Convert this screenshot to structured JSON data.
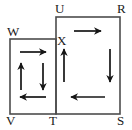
{
  "figure": {
    "type": "geometry-diagram",
    "background_color": "#ffffff",
    "stroke_color": "#4d4d4d",
    "arrow_color": "#161616",
    "label_color": "#1a1a1a",
    "canvas": {
      "width": 132,
      "height": 130
    },
    "labels": {
      "W": "W",
      "U": "U",
      "R": "R",
      "X": "X",
      "V": "V",
      "T": "T",
      "S": "S"
    },
    "label_positions": {
      "W": {
        "x": 7,
        "y": 25
      },
      "U": {
        "x": 55,
        "y": 2
      },
      "R": {
        "x": 117,
        "y": 2
      },
      "X": {
        "x": 57,
        "y": 34
      },
      "V": {
        "x": 6,
        "y": 114
      },
      "T": {
        "x": 49,
        "y": 114
      },
      "S": {
        "x": 117,
        "y": 114
      }
    },
    "rectangles": [
      {
        "name": "left-rectangle-WXTV",
        "vertices": [
          "W",
          "X",
          "T",
          "V"
        ],
        "x": 10,
        "y": 39,
        "width": 46,
        "height": 75
      },
      {
        "name": "right-rectangle-URST",
        "vertices": [
          "U",
          "R",
          "S",
          "T"
        ],
        "x": 56,
        "y": 17,
        "width": 64,
        "height": 97
      }
    ],
    "shared_edge": {
      "name": "edge-XT",
      "from": "X",
      "to": "T"
    },
    "arrows": [
      {
        "name": "left-rect-top-arrow",
        "direction": "right",
        "x1": 20,
        "y1": 52,
        "x2": 46,
        "y2": 52
      },
      {
        "name": "left-rect-inner-up-arrow",
        "direction": "up",
        "x1": 21,
        "y1": 90,
        "x2": 21,
        "y2": 63
      },
      {
        "name": "left-rect-inner-down-arrow",
        "direction": "down",
        "x1": 43,
        "y1": 63,
        "x2": 43,
        "y2": 90
      },
      {
        "name": "left-rect-bottom-arrow",
        "direction": "left",
        "x1": 46,
        "y1": 97,
        "x2": 20,
        "y2": 97
      },
      {
        "name": "right-rect-top-arrow",
        "direction": "right",
        "x1": 74,
        "y1": 31,
        "x2": 101,
        "y2": 31
      },
      {
        "name": "right-rect-left-arrow",
        "direction": "up",
        "x1": 64,
        "y1": 82,
        "x2": 64,
        "y2": 49
      },
      {
        "name": "right-rect-right-arrow",
        "direction": "down",
        "x1": 110,
        "y1": 49,
        "x2": 110,
        "y2": 82
      },
      {
        "name": "right-rect-bottom-arrow",
        "direction": "left",
        "x1": 105,
        "y1": 97,
        "x2": 71,
        "y2": 97
      }
    ]
  }
}
